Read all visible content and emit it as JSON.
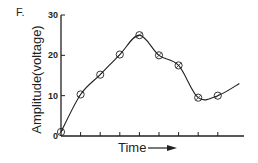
{
  "panel_label": "F.",
  "chart_data": {
    "type": "line",
    "title": "",
    "xlabel": "Time",
    "ylabel": "Amplitude(voltage)",
    "ylim": [
      0,
      30
    ],
    "yticks": [
      0,
      10,
      20,
      30
    ],
    "xticks_count": 9,
    "grid": false,
    "legend": null,
    "annotations": [
      "arrow pointing right after 'Time' label"
    ],
    "series": [
      {
        "name": "amplitude",
        "marker": "open-circle",
        "x": [
          0,
          1,
          2,
          3,
          4,
          5,
          6,
          7,
          8
        ],
        "values": [
          1,
          10.3,
          15.2,
          20.2,
          25,
          20,
          17.5,
          9.5,
          10
        ]
      }
    ],
    "curve_end": {
      "x": 9.1,
      "value": 13
    }
  },
  "colors": {
    "ink": "#231f20",
    "background": "#ffffff"
  }
}
